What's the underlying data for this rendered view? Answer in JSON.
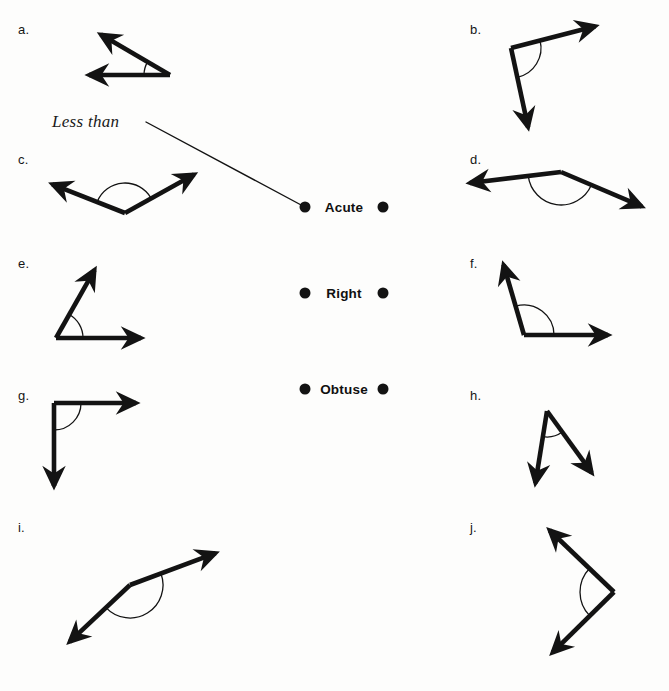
{
  "page": {
    "width": 669,
    "height": 691,
    "background_color": "#fdfdfc",
    "ink_color": "#131313"
  },
  "hint": {
    "text": "Less than",
    "x": 52,
    "y": 112,
    "connector": {
      "x1": 146,
      "y1": 122,
      "x2": 303,
      "y2": 206
    }
  },
  "categories": [
    {
      "key": "acute",
      "label": "Acute",
      "x": 344,
      "y": 207,
      "left_dot": {
        "x": 305,
        "y": 207
      },
      "right_dot": {
        "x": 383,
        "y": 207
      }
    },
    {
      "key": "right",
      "label": "Right",
      "x": 344,
      "y": 293,
      "left_dot": {
        "x": 305,
        "y": 293
      },
      "right_dot": {
        "x": 383,
        "y": 293
      }
    },
    {
      "key": "obtuse",
      "label": "Obtuse",
      "x": 344,
      "y": 389,
      "left_dot": {
        "x": 305,
        "y": 389
      },
      "right_dot": {
        "x": 383,
        "y": 389
      }
    }
  ],
  "figures": [
    {
      "key": "a",
      "label": "a.",
      "label_x": 18,
      "label_y": 22,
      "angle_type": "acute",
      "approx_degrees": 25,
      "vertex": {
        "x": 170,
        "y": 75
      },
      "rays": [
        {
          "x": 93,
          "y": 30
        },
        {
          "x": 80,
          "y": 75
        }
      ],
      "arc_radius": 26,
      "arc_double": false
    },
    {
      "key": "b",
      "label": "b.",
      "label_x": 470,
      "label_y": 22,
      "angle_type": "right",
      "approx_degrees": 96,
      "vertex": {
        "x": 511,
        "y": 48
      },
      "rays": [
        {
          "x": 604,
          "y": 24
        },
        {
          "x": 530,
          "y": 136
        }
      ],
      "arc_radius": 30,
      "arc_double": false
    },
    {
      "key": "c",
      "label": "c.",
      "label_x": 18,
      "label_y": 152,
      "angle_type": "obtuse",
      "approx_degrees": 120,
      "vertex": {
        "x": 125,
        "y": 213
      },
      "rays": [
        {
          "x": 44,
          "y": 181
        },
        {
          "x": 202,
          "y": 170
        }
      ],
      "arc_radius": 30,
      "arc_double": false
    },
    {
      "key": "d",
      "label": "d.",
      "label_x": 470,
      "label_y": 152,
      "angle_type": "obtuse",
      "approx_degrees": 160,
      "vertex": {
        "x": 561,
        "y": 172
      },
      "rays": [
        {
          "x": 461,
          "y": 184
        },
        {
          "x": 650,
          "y": 210
        }
      ],
      "arc_radius": 33,
      "arc_double": false
    },
    {
      "key": "e",
      "label": "e.",
      "label_x": 18,
      "label_y": 256,
      "angle_type": "acute",
      "approx_degrees": 62,
      "vertex": {
        "x": 56,
        "y": 338
      },
      "rays": [
        {
          "x": 99,
          "y": 262
        },
        {
          "x": 150,
          "y": 338
        }
      ],
      "arc_radius": 27,
      "arc_double": false
    },
    {
      "key": "f",
      "label": "f.",
      "label_x": 470,
      "label_y": 256,
      "angle_type": "obtuse",
      "approx_degrees": 101,
      "vertex": {
        "x": 524,
        "y": 335
      },
      "rays": [
        {
          "x": 501,
          "y": 256
        },
        {
          "x": 617,
          "y": 335
        }
      ],
      "arc_radius": 30,
      "arc_double": false
    },
    {
      "key": "g",
      "label": "g.",
      "label_x": 18,
      "label_y": 388,
      "angle_type": "right",
      "approx_degrees": 90,
      "vertex": {
        "x": 54,
        "y": 403
      },
      "rays": [
        {
          "x": 145,
          "y": 403
        },
        {
          "x": 54,
          "y": 495
        }
      ],
      "arc_radius": 27,
      "arc_double": false
    },
    {
      "key": "h",
      "label": "h.",
      "label_x": 470,
      "label_y": 388,
      "angle_type": "acute",
      "approx_degrees": 40,
      "vertex": {
        "x": 547,
        "y": 411
      },
      "rays": [
        {
          "x": 534,
          "y": 492
        },
        {
          "x": 597,
          "y": 480
        }
      ],
      "arc_radius": 26,
      "arc_double": false
    },
    {
      "key": "i",
      "label": "i.",
      "label_x": 18,
      "label_y": 520,
      "angle_type": "obtuse",
      "approx_degrees": 150,
      "vertex": {
        "x": 130,
        "y": 585
      },
      "rays": [
        {
          "x": 224,
          "y": 550
        },
        {
          "x": 63,
          "y": 648
        }
      ],
      "arc_radius": 33,
      "arc_double": false
    },
    {
      "key": "j",
      "label": "j.",
      "label_x": 470,
      "label_y": 520,
      "angle_type": "right",
      "approx_degrees": 92,
      "vertex": {
        "x": 614,
        "y": 592
      },
      "rays": [
        {
          "x": 543,
          "y": 524
        },
        {
          "x": 546,
          "y": 659
        }
      ],
      "arc_radius": 34,
      "arc_double": false
    }
  ]
}
